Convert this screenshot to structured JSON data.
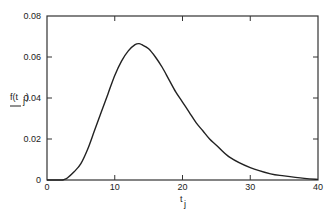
{
  "chart_data": {
    "type": "line",
    "title": "",
    "xlabel": "t_j",
    "ylabel": "f(t_j)",
    "xlim": [
      0,
      40
    ],
    "ylim": [
      0,
      0.08
    ],
    "xticks": [
      0,
      10,
      20,
      30,
      40
    ],
    "yticks": [
      0,
      0.02,
      0.04,
      0.06,
      0.08
    ],
    "xtick_labels": [
      "0",
      "10",
      "20",
      "30",
      "40"
    ],
    "ytick_labels": [
      "0",
      "0.02",
      "0.04",
      "0.06",
      "0.08"
    ],
    "grid": false,
    "legend": null,
    "series": [
      {
        "name": "f(t_j)",
        "x": [
          0,
          2,
          2.5,
          3,
          4,
          5,
          6,
          7,
          8,
          9,
          10,
          11,
          12,
          13,
          13.6,
          14,
          15,
          16,
          17,
          18,
          19,
          20,
          21,
          22,
          23,
          24,
          25,
          27,
          30,
          33,
          35,
          38,
          40
        ],
        "y": [
          0,
          0,
          0.0002,
          0.001,
          0.004,
          0.008,
          0.015,
          0.024,
          0.033,
          0.042,
          0.051,
          0.058,
          0.063,
          0.066,
          0.0665,
          0.066,
          0.064,
          0.06,
          0.055,
          0.049,
          0.043,
          0.038,
          0.033,
          0.028,
          0.024,
          0.02,
          0.017,
          0.011,
          0.006,
          0.003,
          0.002,
          0.0008,
          0.0003
        ]
      }
    ]
  },
  "labels": {
    "x_axis": "t",
    "x_axis_sub": "j",
    "y_axis_main": "f(t",
    "y_axis_sub": "j",
    "y_axis_close": ")"
  }
}
